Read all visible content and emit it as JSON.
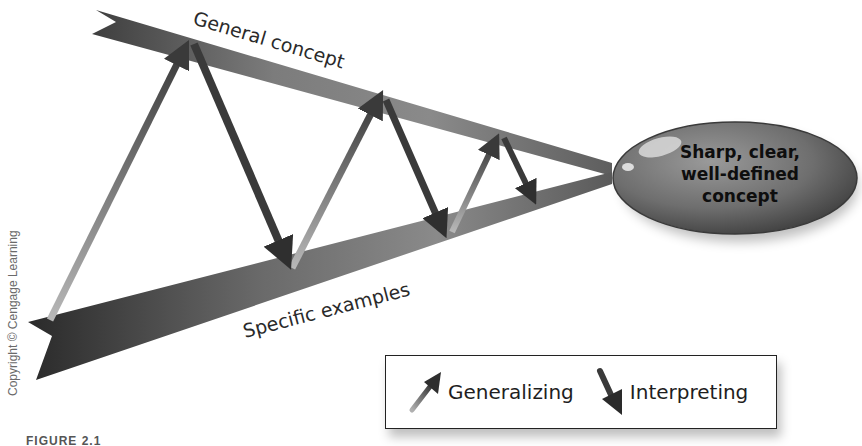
{
  "diagram": {
    "general_label": "General concept",
    "specific_label": "Specific examples",
    "concept_bubble": {
      "line1": "Sharp, clear,",
      "line2": "well-defined",
      "line3": "concept"
    }
  },
  "legend": {
    "generalizing": {
      "label": "Generalizing",
      "icon": "up-right-arrow-icon"
    },
    "interpreting": {
      "label": "Interpreting",
      "icon": "down-right-arrow-icon"
    }
  },
  "credit": "Copyright © Cengage Learning",
  "figure_label": "FIGURE 2.1"
}
